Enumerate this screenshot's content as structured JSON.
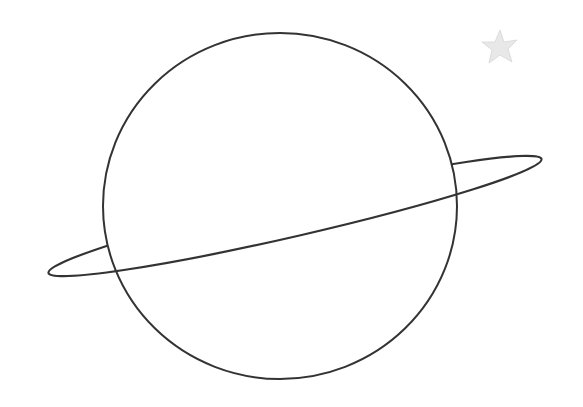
{
  "drawing": {
    "subject": "planet with ring",
    "stroke_color": "#333333",
    "star_color": "#e6e6e6",
    "background": "#ffffff"
  }
}
